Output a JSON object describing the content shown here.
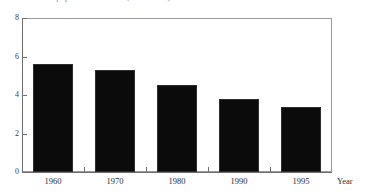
{
  "chart_data": {
    "type": "bar",
    "title": "Rate of natural population increase (1960-1995)",
    "xlabel": "Year",
    "ylabel": "",
    "categories": [
      "1960",
      "1970",
      "1980",
      "1990",
      "1995"
    ],
    "values": [
      5.6,
      5.3,
      4.5,
      3.8,
      3.4
    ],
    "ylim": [
      0,
      8
    ],
    "y_ticks": [
      "0",
      "2",
      "4",
      "6",
      "8"
    ],
    "y_tick_values": [
      0,
      2,
      4,
      6,
      8
    ],
    "grid": false,
    "legend": null,
    "bar_color": "#0b0b0b",
    "frame_color": "#9a9a9a"
  }
}
